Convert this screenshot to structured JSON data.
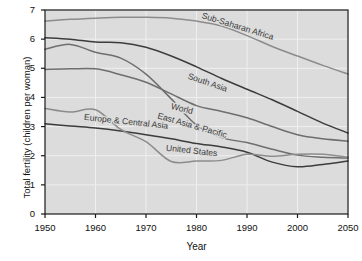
{
  "chart_data": {
    "type": "line",
    "title": "",
    "xlabel": "Year",
    "ylabel": "Total fertility (children per woman)",
    "xlim": [
      1950,
      2010
    ],
    "ylim": [
      0,
      7
    ],
    "xticks": [
      "1950",
      "1960",
      "1970",
      "1980",
      "1990",
      "2000",
      "2050"
    ],
    "xtick_values": [
      1950,
      1960,
      1970,
      1980,
      1990,
      2000,
      2010
    ],
    "yticks": [
      "0",
      "1",
      "2",
      "3",
      "4",
      "5",
      "6",
      "7"
    ],
    "ytick_values": [
      0,
      1,
      2,
      3,
      4,
      5,
      6,
      7
    ],
    "grid": true,
    "legend_position": "inline-labels",
    "plot_background": "#dcdcdc",
    "x": [
      1950,
      1955,
      1960,
      1965,
      1970,
      1975,
      1980,
      1985,
      1990,
      1995,
      2000,
      2005,
      2010
    ],
    "series": [
      {
        "name": "Sub-Saharan Africa",
        "color": "#8c8c8c",
        "label_x": 1988,
        "label_y": 6.35,
        "label_rot": 17,
        "values": [
          6.62,
          6.68,
          6.72,
          6.75,
          6.75,
          6.72,
          6.62,
          6.45,
          6.12,
          5.75,
          5.42,
          5.1,
          4.8
        ]
      },
      {
        "name": "South Asia",
        "color": "#3c3c3c",
        "label_x": 1982,
        "label_y": 4.42,
        "label_rot": 19,
        "values": [
          6.05,
          6.0,
          5.9,
          5.88,
          5.72,
          5.42,
          5.05,
          4.65,
          4.28,
          3.92,
          3.52,
          3.12,
          2.78
        ]
      },
      {
        "name": "World",
        "color": "#6e6e6e",
        "label_x": 1977,
        "label_y": 3.52,
        "label_rot": 14,
        "values": [
          4.96,
          4.98,
          4.98,
          4.78,
          4.52,
          4.12,
          3.72,
          3.52,
          3.3,
          3.0,
          2.72,
          2.58,
          2.5
        ]
      },
      {
        "name": "East Asia & Pacific",
        "color": "#6e6e6e",
        "label_x": 1979,
        "label_y": 2.95,
        "label_rot": 16,
        "values": [
          5.65,
          5.82,
          5.55,
          5.35,
          4.8,
          3.95,
          3.05,
          2.62,
          2.45,
          2.22,
          2.02,
          1.95,
          1.92
        ]
      },
      {
        "name": "Europe & Central Asia",
        "color": "#3c3c3c",
        "label_x": 1966,
        "label_y": 3.08,
        "label_rot": 6,
        "values": [
          3.1,
          3.02,
          2.95,
          2.85,
          2.72,
          2.58,
          2.42,
          2.3,
          2.12,
          1.78,
          1.62,
          1.7,
          1.82
        ]
      },
      {
        "name": "United States",
        "color": "#8c8c8c",
        "label_x": 1979,
        "label_y": 2.08,
        "label_rot": 6,
        "values": [
          3.62,
          3.5,
          3.58,
          2.9,
          2.48,
          1.8,
          1.82,
          1.84,
          2.05,
          1.98,
          2.05,
          2.05,
          1.95
        ]
      }
    ]
  }
}
